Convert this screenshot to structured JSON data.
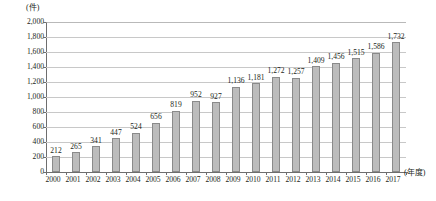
{
  "chart_data": {
    "type": "bar",
    "title": "",
    "xlabel": "(年度)",
    "ylabel": "(件)",
    "ylim": [
      0,
      2000
    ],
    "grid": true,
    "legend": "none",
    "categories": [
      "2000",
      "2001",
      "2002",
      "2003",
      "2004",
      "2005",
      "2006",
      "2007",
      "2008",
      "2009",
      "2010",
      "2011",
      "2012",
      "2013",
      "2014",
      "2015",
      "2016",
      "2017"
    ],
    "values": [
      212,
      265,
      341,
      447,
      524,
      656,
      819,
      952,
      927,
      1136,
      1181,
      1272,
      1257,
      1409,
      1456,
      1515,
      1586,
      1732
    ],
    "value_labels": [
      "212",
      "265",
      "341",
      "447",
      "524",
      "656",
      "819",
      "952",
      "927",
      "1,136",
      "1,181",
      "1,272",
      "1,257",
      "1,409",
      "1,456",
      "1,515",
      "1,586",
      "1,732"
    ],
    "yticks": [
      0,
      200,
      400,
      600,
      800,
      1000,
      1200,
      1400,
      1600,
      1800,
      2000
    ],
    "ytick_labels": [
      "0",
      "200",
      "400",
      "600",
      "800",
      "1,000",
      "1,200",
      "1,400",
      "1,600",
      "1,800",
      "2,000"
    ],
    "colors": {
      "bar_fill": "#bcbcbc",
      "bar_border": "#8a8a8a",
      "gridline": "#c8c8c8",
      "axis": "#6e6e6e",
      "text": "#231f20",
      "background": "#ffffff"
    }
  }
}
